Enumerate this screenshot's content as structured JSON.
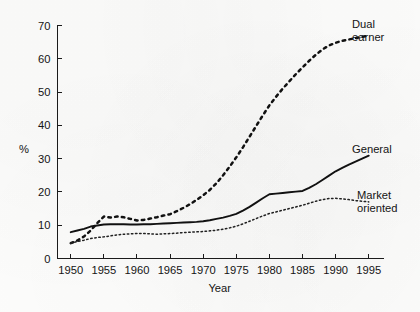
{
  "chart_data": {
    "type": "line",
    "title": "",
    "xlabel": "Year",
    "ylabel": "%",
    "xlim": [
      1948,
      1997
    ],
    "ylim": [
      0,
      70
    ],
    "xticks": [
      1950,
      1955,
      1960,
      1965,
      1970,
      1975,
      1980,
      1985,
      1990,
      1995
    ],
    "yticks": [
      0,
      10,
      20,
      30,
      40,
      50,
      60,
      70
    ],
    "xtick_labels": [
      "1950",
      "1955",
      "1960",
      "1965",
      "1970",
      "1975",
      "1980",
      "1985",
      "1990",
      "1995"
    ],
    "ytick_labels": [
      "0",
      "10",
      "20",
      "30",
      "40",
      "50",
      "60",
      "70"
    ],
    "grid": false,
    "legend_position": "inline-right-labels",
    "x": [
      1950,
      1951,
      1952,
      1953,
      1954,
      1955,
      1956,
      1957,
      1958,
      1959,
      1960,
      1961,
      1962,
      1963,
      1964,
      1965,
      1966,
      1967,
      1968,
      1969,
      1970,
      1971,
      1972,
      1973,
      1974,
      1975,
      1976,
      1977,
      1978,
      1979,
      1980,
      1981,
      1982,
      1983,
      1984,
      1985,
      1986,
      1987,
      1988,
      1989,
      1990,
      1991,
      1992,
      1993,
      1994,
      1995
    ],
    "series": [
      {
        "name": "Dual earner",
        "label": "Dual\nearner",
        "label_line1": "Dual",
        "label_line2": "earner",
        "style": "dashed",
        "values": [
          4.6,
          5.4,
          6.6,
          8.4,
          10.6,
          12.6,
          12.3,
          12.6,
          12.4,
          11.9,
          11.4,
          11.6,
          12.0,
          12.4,
          12.9,
          13.3,
          14.2,
          15.2,
          16.3,
          17.6,
          19.0,
          20.6,
          22.6,
          25.0,
          27.6,
          30.4,
          33.4,
          36.6,
          39.8,
          43.0,
          46.0,
          48.6,
          51.0,
          53.2,
          55.4,
          57.4,
          59.4,
          61.2,
          62.8,
          64.0,
          64.8,
          65.4,
          65.8,
          66.2,
          66.6,
          67.0
        ]
      },
      {
        "name": "General",
        "label": "General",
        "style": "solid",
        "values": [
          7.9,
          8.4,
          8.9,
          9.6,
          9.9,
          10.2,
          10.3,
          10.3,
          10.3,
          10.2,
          10.2,
          10.3,
          10.3,
          10.4,
          10.5,
          10.6,
          10.7,
          10.8,
          10.9,
          11.0,
          11.2,
          11.5,
          11.9,
          12.3,
          12.8,
          13.4,
          14.4,
          15.5,
          16.8,
          18.1,
          19.3,
          19.5,
          19.7,
          19.9,
          20.1,
          20.3,
          21.2,
          22.3,
          23.6,
          24.9,
          26.2,
          27.2,
          28.2,
          29.1,
          30.0,
          30.9
        ]
      },
      {
        "name": "Market oriented",
        "label": "Market\noriented",
        "label_line1": "Market",
        "label_line2": "oriented",
        "style": "dotted",
        "values": [
          4.6,
          5.1,
          5.5,
          6.0,
          6.3,
          6.5,
          6.8,
          7.1,
          7.3,
          7.4,
          7.5,
          7.5,
          7.4,
          7.3,
          7.4,
          7.5,
          7.6,
          7.8,
          7.9,
          8.0,
          8.1,
          8.3,
          8.5,
          8.8,
          9.2,
          9.7,
          10.4,
          11.2,
          12.0,
          12.8,
          13.5,
          14.0,
          14.5,
          15.0,
          15.5,
          16.0,
          16.6,
          17.2,
          17.7,
          18.0,
          18.1,
          17.9,
          17.7,
          17.4,
          17.2,
          17.0
        ]
      }
    ]
  }
}
